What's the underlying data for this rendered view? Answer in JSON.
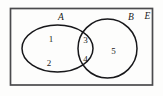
{
  "figure": {
    "kind": "venn-diagram",
    "background_color": "#fdfdfc"
  },
  "universe": {
    "label": "E",
    "name": "universal-set",
    "border_color": "#4a4a4d",
    "fill_color": "#fdfdfc"
  },
  "sets": [
    {
      "id": "A",
      "label": "A",
      "shape": "ellipse",
      "stroke_color": "#17171a"
    },
    {
      "id": "B",
      "label": "B",
      "shape": "ellipse",
      "stroke_color": "#17171a"
    }
  ],
  "regions": [
    {
      "id": "a-only-upper",
      "label": "1",
      "belongs_to": "A only"
    },
    {
      "id": "a-only-lower",
      "label": "2",
      "belongs_to": "A only"
    },
    {
      "id": "intersect-upper",
      "label": "3",
      "belongs_to": "A and B"
    },
    {
      "id": "intersect-lower",
      "label": "4",
      "belongs_to": "A and B"
    },
    {
      "id": "b-only",
      "label": "5",
      "belongs_to": "B only"
    }
  ]
}
